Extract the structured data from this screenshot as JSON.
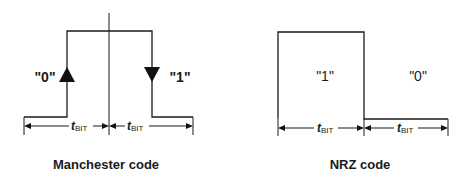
{
  "manchester": {
    "caption": "Manchester code",
    "bit_left_label": "\"0\"",
    "bit_right_label": "\"1\"",
    "period_left": {
      "t": "t",
      "sub": "BIT"
    },
    "period_right": {
      "t": "t",
      "sub": "BIT"
    },
    "transition_left": "rising-edge (0)",
    "transition_right": "falling-edge (1)"
  },
  "nrz": {
    "caption": "NRZ code",
    "bit_left_label": "\"1\"",
    "bit_right_label": "\"0\"",
    "period_left": {
      "t": "t",
      "sub": "BIT"
    },
    "period_right": {
      "t": "t",
      "sub": "BIT"
    }
  },
  "colors": {
    "line": "#1a1a1a",
    "background": "#ffffff"
  }
}
